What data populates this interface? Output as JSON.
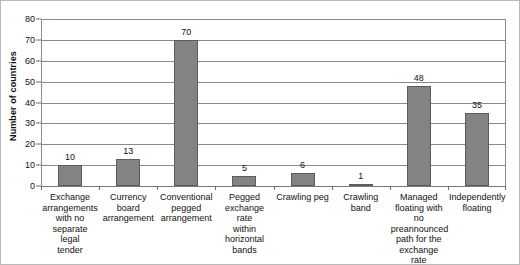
{
  "chart_data": {
    "type": "bar",
    "title": "",
    "subtitle": "",
    "xlabel": "",
    "ylabel": "Number of countries",
    "ylim": [
      0,
      80
    ],
    "ytick_step": 10,
    "yticks": [
      0,
      10,
      20,
      30,
      40,
      50,
      60,
      70,
      80
    ],
    "grid": true,
    "legend": false,
    "legend_position": "none",
    "bar_color": "#838383",
    "bar_edge_color": "#5c5c5c",
    "gridline_color": "#8a8a8a",
    "categories": [
      "Exchange arrangements with no separate legal tender",
      "Currency board arrangement",
      "Conventional pegged arrangement",
      "Pegged exchange rate within horizontal bands",
      "Crawling peg",
      "Crawling band",
      "Managed floating with no preannounced path for the exchange rate",
      "Independently floating"
    ],
    "category_label_lines": [
      [
        "Exchange",
        "arrangements",
        "with no",
        "separate legal",
        "tender"
      ],
      [
        "Currency",
        "board",
        "arrangement"
      ],
      [
        "Conventional",
        "pegged",
        "arrangement"
      ],
      [
        "Pegged",
        "exchange rate",
        "within",
        "horizontal",
        "bands"
      ],
      [
        "Crawling peg"
      ],
      [
        "Crawling band"
      ],
      [
        "Managed",
        "floating with",
        "no",
        "preannounced",
        "path for the",
        "exchange rate"
      ],
      [
        "Independently",
        "floating"
      ]
    ],
    "values": [
      10,
      13,
      70,
      5,
      6,
      1,
      48,
      35
    ],
    "value_labels": [
      "10",
      "13",
      "70",
      "5",
      "6",
      "1",
      "48",
      "35"
    ]
  }
}
